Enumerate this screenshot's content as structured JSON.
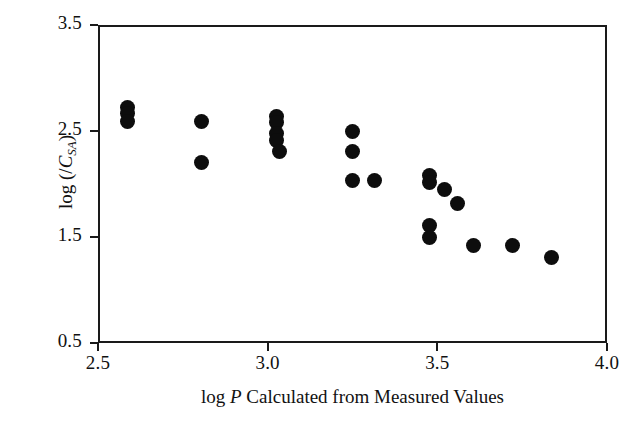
{
  "chart_data": {
    "type": "scatter",
    "title": "",
    "xlabel_parts": {
      "pre": "log ",
      "italic": "P",
      "post": " Calculated from Measured Values"
    },
    "xlabel": "log P Calculated from Measured Values",
    "ylabel_parts": {
      "pre": "log (/",
      "italic": "C",
      "sub": "SA",
      "post": ")"
    },
    "ylabel": "log (/C_SA)",
    "xlim": [
      2.5,
      4.0
    ],
    "ylim": [
      0.5,
      3.5
    ],
    "xticks": [
      2.5,
      3.0,
      3.5,
      4.0
    ],
    "xticklabels": [
      "2.5",
      "3.0",
      "3.5",
      "4.0"
    ],
    "yticks": [
      3.5,
      2.5,
      1.5,
      0.5
    ],
    "yticklabels": [
      "3.5",
      "2.5",
      "1.5",
      "0.5"
    ],
    "grid": false,
    "legend": null,
    "marker": {
      "shape": "circle",
      "color": "#0d0d0d",
      "size": 15
    },
    "frame_color": "#1a1a1a",
    "points": [
      {
        "x": 2.58,
        "y": 2.74
      },
      {
        "x": 2.58,
        "y": 2.685
      },
      {
        "x": 2.58,
        "y": 2.61
      },
      {
        "x": 2.8,
        "y": 2.605
      },
      {
        "x": 2.8,
        "y": 2.225
      },
      {
        "x": 3.02,
        "y": 2.66
      },
      {
        "x": 3.02,
        "y": 2.6
      },
      {
        "x": 3.02,
        "y": 2.495
      },
      {
        "x": 3.02,
        "y": 2.43
      },
      {
        "x": 3.03,
        "y": 2.325
      },
      {
        "x": 3.245,
        "y": 2.515
      },
      {
        "x": 3.245,
        "y": 2.325
      },
      {
        "x": 3.245,
        "y": 2.055
      },
      {
        "x": 3.31,
        "y": 2.055
      },
      {
        "x": 3.47,
        "y": 2.1
      },
      {
        "x": 3.47,
        "y": 2.03
      },
      {
        "x": 3.515,
        "y": 1.965
      },
      {
        "x": 3.47,
        "y": 1.625
      },
      {
        "x": 3.47,
        "y": 1.51
      },
      {
        "x": 3.555,
        "y": 1.835
      },
      {
        "x": 3.6,
        "y": 1.435
      },
      {
        "x": 3.715,
        "y": 1.435
      },
      {
        "x": 3.83,
        "y": 1.33
      }
    ]
  }
}
